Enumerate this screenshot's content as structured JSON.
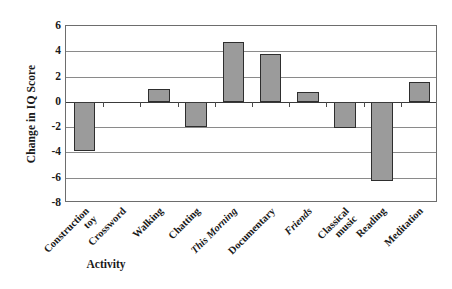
{
  "chart_data": {
    "type": "bar",
    "title": "",
    "xlabel": "Activity",
    "ylabel": "Change in IQ Score",
    "ylim": [
      -8,
      6
    ],
    "ytick_step": 2,
    "grid": true,
    "legend": "none",
    "bar_fill_color": "#9b9b9b",
    "bar_edge_color": "#2e2e2e",
    "categories": [
      "Construction toy",
      "Crossword",
      "Walking",
      "Chatting",
      "This Morning",
      "Documentary",
      "Friends",
      "Classical music",
      "Reading",
      "Meditation"
    ],
    "values": [
      -3.9,
      0,
      1.0,
      -2.0,
      4.7,
      3.8,
      0.8,
      -2.1,
      -6.3,
      1.6
    ],
    "ytick_labels": [
      "6",
      "4",
      "2",
      "0",
      "-2",
      "-4",
      "-6",
      "-8"
    ],
    "ytick_values": [
      6,
      4,
      2,
      0,
      -2,
      -4,
      -6,
      -8
    ],
    "category_label_lines": [
      [
        "Construction",
        "toy"
      ],
      [
        "Crossword"
      ],
      [
        "Walking"
      ],
      [
        "Chatting"
      ],
      [
        "This Morning"
      ],
      [
        "Documentary"
      ],
      [
        "Friends"
      ],
      [
        "Classical",
        "music"
      ],
      [
        "Reading"
      ],
      [
        "Meditation"
      ]
    ],
    "italic_categories": [
      "This Morning",
      "Friends"
    ]
  },
  "bottom_caption": ""
}
